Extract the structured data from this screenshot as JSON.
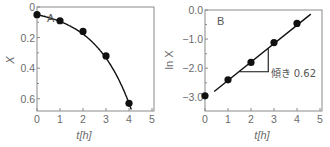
{
  "chart_data": [
    {
      "type": "line",
      "panel_label": "A",
      "title": "",
      "xlabel": "t[h]",
      "ylabel": "X",
      "xlim": [
        0,
        5
      ],
      "ylim": [
        0,
        0.7
      ],
      "xticks": [
        0,
        1,
        2,
        3,
        4,
        5
      ],
      "xtick_labels": [
        "0",
        "1",
        "2",
        "3",
        "4",
        "5"
      ],
      "yticks": [
        0,
        0.2,
        0.4,
        0.6
      ],
      "ytick_labels": [
        "0",
        "0.2",
        "0.4",
        "0.6"
      ],
      "grid": false,
      "series": [
        {
          "name": "measured X",
          "marker": "filled-circle",
          "x": [
            0,
            1,
            2,
            3,
            4
          ],
          "y": [
            0.05,
            0.09,
            0.16,
            0.32,
            0.63
          ]
        },
        {
          "name": "exponential fit",
          "style": "solid-line",
          "x": [
            0,
            0.5,
            1,
            1.5,
            2,
            2.5,
            3,
            3.5,
            4,
            4.1
          ],
          "y": [
            0.05,
            0.068,
            0.093,
            0.127,
            0.172,
            0.235,
            0.32,
            0.436,
            0.595,
            0.67
          ]
        }
      ]
    },
    {
      "type": "line",
      "panel_label": "B",
      "title": "",
      "xlabel": "t[h]",
      "ylabel": "ln X",
      "xlim": [
        0,
        5
      ],
      "ylim": [
        -3.35,
        0.0
      ],
      "xticks": [
        0,
        1,
        2,
        3,
        4,
        5
      ],
      "xtick_labels": [
        "0",
        "1",
        "2",
        "3",
        "4",
        "5"
      ],
      "yticks": [
        0.0,
        -1.0,
        -2.0,
        -3.0
      ],
      "ytick_labels": [
        "0.0",
        "−1.0",
        "−2.0",
        "−3.0"
      ],
      "grid": false,
      "series": [
        {
          "name": "measured ln X",
          "marker": "filled-circle",
          "x": [
            0,
            1,
            2,
            3,
            4
          ],
          "y": [
            -2.95,
            -2.4,
            -1.8,
            -1.12,
            -0.46
          ]
        },
        {
          "name": "linear fit",
          "style": "solid-line",
          "x": [
            0.4,
            4.6
          ],
          "y": [
            -2.8,
            -0.14
          ]
        }
      ],
      "annotations": [
        {
          "type": "slope-triangle",
          "x0": 1.5,
          "x1": 2.75,
          "y_base": -2.12,
          "y_top": -1.32
        },
        {
          "type": "text",
          "text": "傾き 0.62",
          "x": 2.85,
          "y": -2.15
        }
      ]
    }
  ]
}
